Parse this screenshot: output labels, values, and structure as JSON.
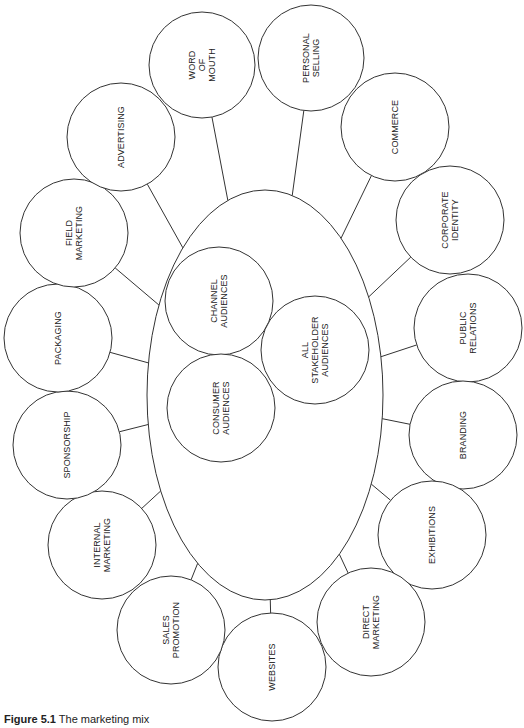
{
  "diagram": {
    "center": {
      "label": "",
      "cx": 265,
      "cy": 395,
      "rx": 118,
      "ry": 205,
      "audiences": [
        {
          "id": "channel",
          "label": "CHANNEL\nAUDIENCES",
          "cx": 219,
          "cy": 301,
          "r": 54
        },
        {
          "id": "consumer",
          "label": "CONSUMER\nAUDIENCES",
          "cx": 221,
          "cy": 408,
          "r": 54
        },
        {
          "id": "stakeholder",
          "label": "ALL\nSTAKEHOLDER\nAUDIENCES",
          "cx": 315,
          "cy": 350,
          "r": 54
        }
      ]
    },
    "tools": [
      {
        "id": "word-of-mouth",
        "label": "WORD\nOF\nMOUTH",
        "cx": 202,
        "cy": 65,
        "r": 53
      },
      {
        "id": "personal-selling",
        "label": "PERSONAL\nSELLING",
        "cx": 311,
        "cy": 58,
        "r": 53
      },
      {
        "id": "commerce",
        "label": "COMMERCE",
        "cx": 395,
        "cy": 127,
        "r": 54
      },
      {
        "id": "corporate-identity",
        "label": "CORPORATE\nIDENTITY",
        "cx": 450,
        "cy": 220,
        "r": 54
      },
      {
        "id": "public-relations",
        "label": "PUBLIC\nRELATIONS",
        "cx": 468,
        "cy": 328,
        "r": 54
      },
      {
        "id": "branding",
        "label": "BRANDING",
        "cx": 463,
        "cy": 435,
        "r": 54
      },
      {
        "id": "exhibitions",
        "label": "EXHIBITIONS",
        "cx": 432,
        "cy": 535,
        "r": 54
      },
      {
        "id": "direct-marketing",
        "label": "DIRECT\nMARKETING",
        "cx": 371,
        "cy": 622,
        "r": 54
      },
      {
        "id": "websites",
        "label": "WEBSITES",
        "cx": 272,
        "cy": 667,
        "r": 54
      },
      {
        "id": "sales-promotion",
        "label": "SALES\nPROMOTION",
        "cx": 171,
        "cy": 630,
        "r": 54
      },
      {
        "id": "internal-marketing",
        "label": "INTERNAL\nMARKETING",
        "cx": 102,
        "cy": 545,
        "r": 54
      },
      {
        "id": "sponsorship",
        "label": "SPONSORSHIP",
        "cx": 67,
        "cy": 445,
        "r": 54
      },
      {
        "id": "packaging",
        "label": "PACKAGING",
        "cx": 58,
        "cy": 338,
        "r": 54
      },
      {
        "id": "field-marketing",
        "label": "FIELD\nMARKETING",
        "cx": 74,
        "cy": 233,
        "r": 54
      },
      {
        "id": "advertising",
        "label": "ADVERTISING",
        "cx": 121,
        "cy": 137,
        "r": 54
      }
    ],
    "stroke_color": "#333333",
    "fill_color": "#ffffff"
  },
  "caption": {
    "figure": "Figure 5.1",
    "text": "The marketing mix"
  }
}
